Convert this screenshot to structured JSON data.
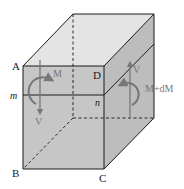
{
  "figure": {
    "colors": {
      "top_face": "#e4e4e4",
      "front_face": "#c6c6c6",
      "side_face": "#bdbdbd",
      "edge": "#1a1a1a",
      "arrow": "#777777"
    },
    "labels": {
      "A": "A",
      "B": "B",
      "C": "C",
      "D": "D",
      "m": "m",
      "n": "n",
      "left_moment": "M",
      "left_shear": "V",
      "right_shear": "V",
      "right_moment": "M+dM"
    }
  }
}
